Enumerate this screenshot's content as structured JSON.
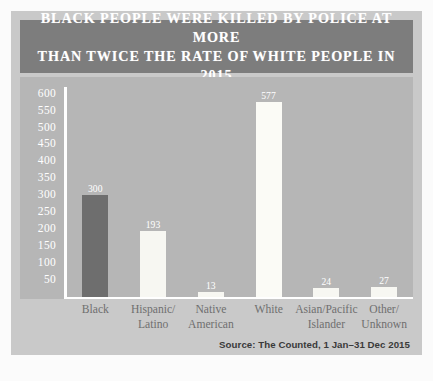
{
  "chart_data": {
    "type": "bar",
    "title": "BLACK PEOPLE WERE KILLED BY POLICE AT MORE\nTHAN TWICE THE RATE OF WHITE PEOPLE IN 2015",
    "xlabel": "",
    "ylabel": "",
    "categories": [
      "Black",
      "Hispanic/\nLatino",
      "Native\nAmerican",
      "White",
      "Asian/Pacific\nIslander",
      "Other/\nUnknown"
    ],
    "values": [
      300,
      193,
      13,
      577,
      24,
      27
    ],
    "value_labels": [
      "300",
      "193",
      "13",
      "577",
      "24",
      "27"
    ],
    "bar_colors": [
      "#6e6e6e",
      "#f7f7f2",
      "#f7f7f2",
      "#fbfbf6",
      "#f7f7f2",
      "#f7f7f2"
    ],
    "ylim": [
      0,
      620
    ],
    "yticks": [
      50,
      100,
      150,
      200,
      250,
      300,
      350,
      400,
      450,
      500,
      550,
      600
    ],
    "ytick_labels": [
      "50",
      "100",
      "150",
      "200",
      "250",
      "300",
      "350",
      "400",
      "450",
      "500",
      "550",
      "600"
    ],
    "grid": false,
    "legend": "none",
    "source": "Source: The Counted, 1 Jan–31 Dec 2015",
    "colors": {
      "title_banner": "#7d7d7d",
      "title_text": "#ffffff",
      "plot_background": "#b6b6b6",
      "card_background": "#c9c9c9",
      "page_background": "#fbfbfb",
      "axis_line": "#ffffff",
      "highlight_bar": "#6e6e6e",
      "standard_bar": "#f7f7f2",
      "x_label_text": "#6f6f6f",
      "source_text": "#3a3a3a"
    }
  }
}
